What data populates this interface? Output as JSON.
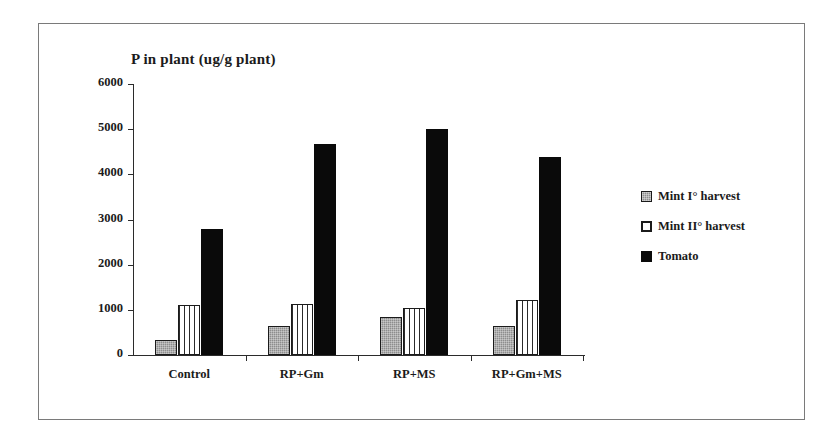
{
  "chart_data": {
    "type": "bar",
    "title": "P in plant (ug/g plant)",
    "xlabel": "",
    "ylabel": "",
    "ylim": [
      0,
      6000
    ],
    "yticks": [
      0,
      1000,
      2000,
      3000,
      4000,
      5000,
      6000
    ],
    "ytick_labels": [
      "0",
      "1000",
      "2000",
      "3000",
      "4000",
      "5000",
      "6000"
    ],
    "grid": false,
    "legend_position": "right",
    "categories": [
      "Control",
      "RP+Gm",
      "RP+MS",
      "RP+Gm+MS"
    ],
    "series": [
      {
        "name": "Mint I° harvest",
        "fill": "gray-textured",
        "color": "#8d8d8d",
        "values": [
          330,
          640,
          840,
          640
        ]
      },
      {
        "name": "Mint II° harvest",
        "fill": "white-vertical-stripes",
        "color": "#ffffff",
        "values": [
          1100,
          1130,
          1050,
          1220
        ]
      },
      {
        "name": "Tomato",
        "fill": "solid-black",
        "color": "#0a0a0a",
        "values": [
          2800,
          4680,
          5000,
          4390
        ]
      }
    ]
  },
  "figure": {
    "border_color": "#7a7a7a",
    "background": "#ffffff",
    "axis_color": "#2b2b2b"
  }
}
